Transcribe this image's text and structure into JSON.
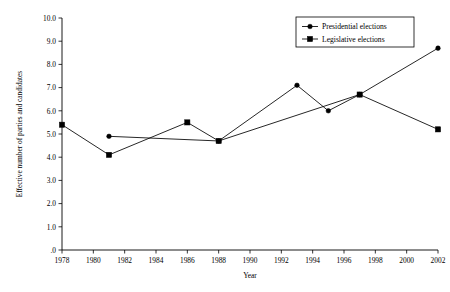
{
  "chart_data": {
    "type": "line",
    "title": "",
    "xlabel": "Year",
    "ylabel": "Effective number of parties and candidates",
    "xlim": [
      1978,
      2002
    ],
    "ylim": [
      0,
      10
    ],
    "grid": false,
    "legend_position": "top-right",
    "x_ticks": [
      1978,
      1980,
      1982,
      1984,
      1986,
      1988,
      1990,
      1992,
      1994,
      1996,
      1998,
      2000,
      2002
    ],
    "x_tick_labels": [
      "1978",
      "1980",
      "1982",
      "1984",
      "1986",
      "1988",
      "1990",
      "1992",
      "1994",
      "1996",
      "1998",
      "2000",
      "2002"
    ],
    "y_ticks": [
      0,
      1,
      2,
      3,
      4,
      5,
      6,
      7,
      8,
      9,
      10
    ],
    "y_tick_labels": [
      ".0",
      "1.0",
      "2.0",
      "3.0",
      "4.0",
      "5.0",
      "6.0",
      "7.0",
      "8.0",
      "9.0",
      "10.0"
    ],
    "series": [
      {
        "name": "Presidential elections",
        "marker": "circle",
        "x": [
          1981,
          1988,
          1993,
          1995,
          1997,
          2002
        ],
        "values": [
          4.9,
          4.7,
          7.1,
          6.0,
          6.7,
          8.7
        ]
      },
      {
        "name": "Legislative elections",
        "marker": "square",
        "x": [
          1978,
          1981,
          1986,
          1988,
          1997,
          2002
        ],
        "values": [
          5.4,
          4.1,
          5.5,
          4.7,
          6.7,
          5.2
        ]
      }
    ]
  },
  "legend": {
    "entries": [
      {
        "label": "Presidential elections",
        "marker": "circle"
      },
      {
        "label": "Legislative elections",
        "marker": "square"
      }
    ]
  },
  "axes": {
    "x_title": "Year",
    "y_title": "Effective number of parties and candidates"
  }
}
